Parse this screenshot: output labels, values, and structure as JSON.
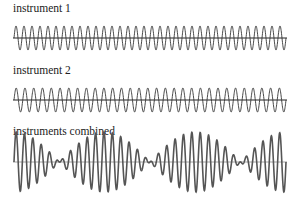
{
  "panels": [
    {
      "label": "instrument 1",
      "cycles": 34,
      "amplitude": 1.0
    },
    {
      "label": "instrument 2",
      "cycles": 31,
      "amplitude": 1.0
    },
    {
      "label": "instruments combined",
      "components": [
        0,
        1
      ]
    }
  ],
  "colors": {
    "wave": "#333333",
    "combined": "#555555",
    "axis": "#222222"
  }
}
